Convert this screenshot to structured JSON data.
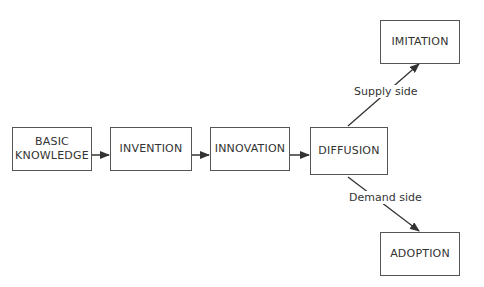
{
  "diagram": {
    "nodes": [
      {
        "id": "basic_knowledge",
        "label": "BASIC\nKNOWLEDGE",
        "line1": "BASIC",
        "line2": "KNOWLEDGE"
      },
      {
        "id": "invention",
        "label": "INVENTION"
      },
      {
        "id": "innovation",
        "label": "INNOVATION"
      },
      {
        "id": "diffusion",
        "label": "DIFFUSION"
      },
      {
        "id": "imitation",
        "label": "IMITATION"
      },
      {
        "id": "adoption",
        "label": "ADOPTION"
      }
    ],
    "edges": [
      {
        "from": "basic_knowledge",
        "to": "invention",
        "label": ""
      },
      {
        "from": "invention",
        "to": "innovation",
        "label": ""
      },
      {
        "from": "innovation",
        "to": "diffusion",
        "label": ""
      },
      {
        "from": "diffusion",
        "to": "imitation",
        "label": "Supply side"
      },
      {
        "from": "diffusion",
        "to": "adoption",
        "label": "Demand side"
      }
    ]
  }
}
